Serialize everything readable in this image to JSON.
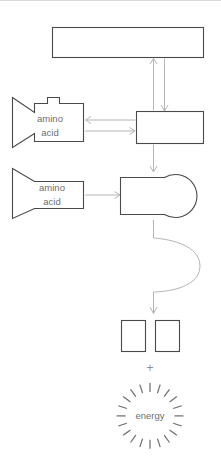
{
  "diagram": {
    "background_color": "#ffffff",
    "shape_stroke_color": "#4a4a4a",
    "connector_color": "#b4b4b4",
    "text_color": "#6e6e6e",
    "ray_color": "#6b6b6b",
    "top_rule_color": "#d8d8d8"
  },
  "shapes": {
    "top_bar": {
      "name": "mrna-strand-bar",
      "label": "",
      "x": 52,
      "y": 27,
      "width": 152,
      "height": 31
    },
    "middle_box": {
      "name": "transfer-box",
      "label": "",
      "x": 136,
      "y": 111,
      "width": 68,
      "height": 33
    },
    "trna_upper": {
      "name": "trna-with-amino-acid-upper",
      "label_line1": "amino",
      "label_line2": "acid",
      "x": 12,
      "y": 97,
      "width": 72,
      "height": 51,
      "has_top_tab": true
    },
    "trna_lower": {
      "name": "trna-with-amino-acid-lower",
      "label_line1": "amino",
      "label_line2": "acid",
      "x": 12,
      "y": 168,
      "width": 72,
      "height": 51,
      "has_top_tab": false
    },
    "ribosome": {
      "name": "ribosome-shape",
      "label": "",
      "x": 120,
      "y": 172,
      "width": 85,
      "height": 48
    },
    "product_box_left": {
      "name": "product-box-left",
      "label": "",
      "x": 121,
      "y": 320,
      "width": 25,
      "height": 32
    },
    "product_box_right": {
      "name": "product-box-right",
      "label": "",
      "x": 155,
      "y": 320,
      "width": 25,
      "height": 32
    }
  },
  "annotations": {
    "plus_sign": "+",
    "energy_label": "energy",
    "energy_ray_count": 20
  },
  "connectors": [
    {
      "name": "arrow-up-top-bar",
      "direction": "up"
    },
    {
      "name": "arrow-down-to-middle-box",
      "direction": "down"
    },
    {
      "name": "arrow-left-to-trna-upper",
      "direction": "left"
    },
    {
      "name": "arrow-right-to-middle-box",
      "direction": "right"
    },
    {
      "name": "arrow-down-middle-box-to-ribosome",
      "direction": "down"
    },
    {
      "name": "arrow-right-trna-lower-to-ribosome",
      "direction": "right"
    },
    {
      "name": "curved-arrow-ribosome-to-products",
      "direction": "curve-down"
    }
  ]
}
